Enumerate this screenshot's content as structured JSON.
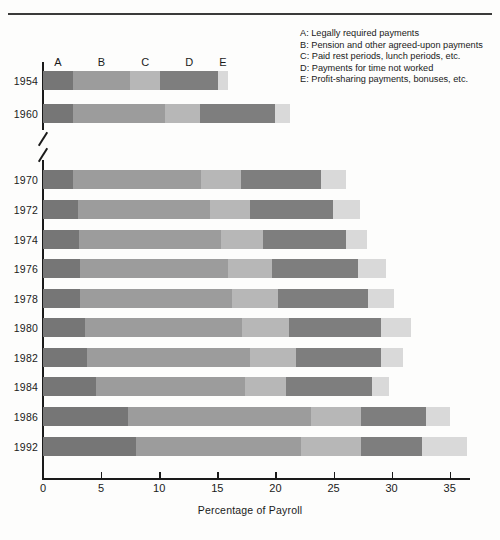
{
  "header": {
    "ghost_text": ""
  },
  "legend": {
    "items": [
      {
        "key": "A:",
        "label": "Legally required payments"
      },
      {
        "key": "B:",
        "label": "Pension and other agreed-upon payments"
      },
      {
        "key": "C:",
        "label": "Paid rest periods, lunch periods, etc."
      },
      {
        "key": "D:",
        "label": "Payments for time not worked"
      },
      {
        "key": "E:",
        "label": "Profit-sharing payments, bonuses, etc."
      }
    ]
  },
  "column_letters": [
    "A",
    "B",
    "C",
    "D",
    "E"
  ],
  "chart_data": {
    "type": "bar",
    "orientation": "horizontal",
    "stacked": true,
    "title": "",
    "xlabel": "Percentage of Payroll",
    "ylabel": "",
    "xlim": [
      0,
      36.5
    ],
    "xticks": [
      0,
      5,
      10,
      15,
      20,
      25,
      30,
      35
    ],
    "xticklabels": [
      "0",
      "5",
      "10",
      "15",
      "20",
      "25",
      "30",
      "35"
    ],
    "grid": false,
    "legend_position": "top-right",
    "axis_break_after_category": "1960",
    "categories": [
      "1954",
      "1960",
      "1970",
      "1972",
      "1974",
      "1976",
      "1978",
      "1980",
      "1982",
      "1984",
      "1986",
      "1992"
    ],
    "series": [
      {
        "name": "A",
        "label": "Legally required payments",
        "color": "#767676",
        "values": [
          2.6,
          2.6,
          2.6,
          3.0,
          3.1,
          3.2,
          3.2,
          3.6,
          3.8,
          4.6,
          7.3,
          8.0
        ]
      },
      {
        "name": "B",
        "label": "Pension and other agreed-upon payments",
        "color": "#9c9c9c",
        "values": [
          4.9,
          7.9,
          11.0,
          11.4,
          12.2,
          12.7,
          13.1,
          13.5,
          14.0,
          12.8,
          15.8,
          14.2
        ]
      },
      {
        "name": "C",
        "label": "Paid rest periods, lunch periods, etc.",
        "color": "#b7b7b7",
        "values": [
          2.6,
          3.0,
          3.4,
          3.4,
          3.6,
          3.8,
          3.9,
          4.1,
          4.0,
          3.5,
          4.3,
          5.2
        ]
      },
      {
        "name": "D",
        "label": "Payments for time not worked",
        "color": "#7e7e7e",
        "values": [
          5.0,
          6.5,
          6.9,
          7.2,
          7.2,
          7.4,
          7.8,
          7.9,
          7.3,
          7.4,
          5.6,
          5.2
        ]
      },
      {
        "name": "E",
        "label": "Profit-sharing payments, bonuses, etc.",
        "color": "#d9d9d9",
        "values": [
          0.8,
          1.3,
          2.2,
          2.3,
          1.8,
          2.4,
          2.2,
          2.6,
          1.9,
          1.5,
          2.0,
          3.9
        ]
      }
    ],
    "totals": [
      15.9,
      21.3,
      26.1,
      27.3,
      27.9,
      29.5,
      30.2,
      31.7,
      31.0,
      29.8,
      35.0,
      36.5
    ]
  },
  "colors": {
    "axis": "#1a1a1a",
    "background": "#fdfdfc"
  }
}
